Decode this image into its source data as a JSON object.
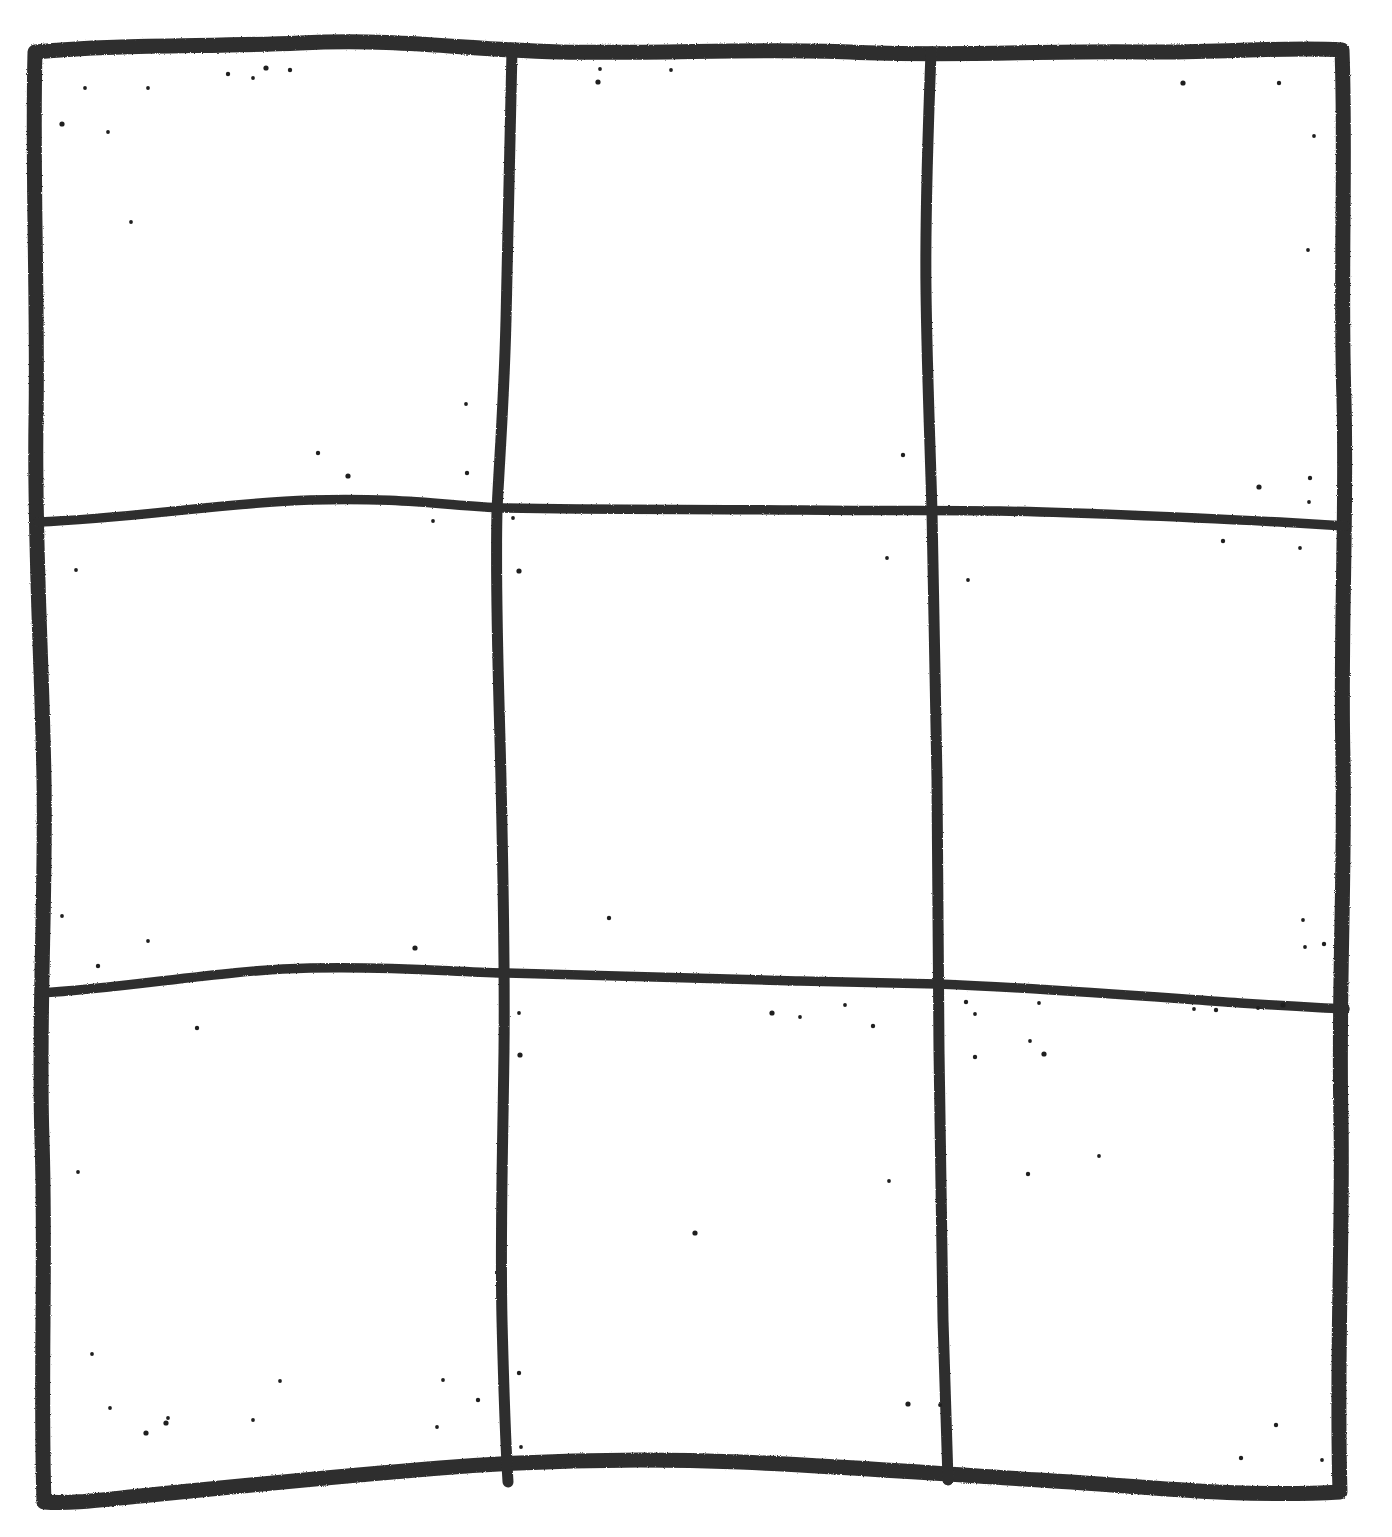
{
  "document": {
    "title": "Hand-drawn tic-tac-toe grid",
    "medium": "black marker on white paper (scanned)",
    "canvas": {
      "width": 1392,
      "height": 1537
    },
    "background_color": "#ffffff",
    "ink_color": "#2f2f2f",
    "speckle_color": "#1f1f1f"
  },
  "grid": {
    "rows": 3,
    "columns": 3,
    "style": "hand-drawn wobbly marker strokes",
    "outer_border": {
      "name": "outer-border",
      "stroke_width_px": 14,
      "top_y": 52,
      "bottom_y": 1480,
      "left_x": 40,
      "right_x": 1340
    },
    "vertical_dividers": [
      {
        "name": "vertical-divider-1",
        "approx_x": 503,
        "stroke_width_px": 10
      },
      {
        "name": "vertical-divider-2",
        "approx_x": 935,
        "stroke_width_px": 10
      }
    ],
    "horizontal_dividers": [
      {
        "name": "horizontal-divider-1",
        "approx_y": 512,
        "stroke_width_px": 9
      },
      {
        "name": "horizontal-divider-2",
        "approx_y": 978,
        "stroke_width_px": 9
      }
    ],
    "cells": [
      {
        "id": "cell-top-left",
        "row": 0,
        "col": 0,
        "mark": ""
      },
      {
        "id": "cell-top-center",
        "row": 0,
        "col": 1,
        "mark": ""
      },
      {
        "id": "cell-top-right",
        "row": 0,
        "col": 2,
        "mark": ""
      },
      {
        "id": "cell-middle-left",
        "row": 1,
        "col": 0,
        "mark": ""
      },
      {
        "id": "cell-middle-center",
        "row": 1,
        "col": 1,
        "mark": ""
      },
      {
        "id": "cell-middle-right",
        "row": 1,
        "col": 2,
        "mark": ""
      },
      {
        "id": "cell-bottom-left",
        "row": 2,
        "col": 0,
        "mark": ""
      },
      {
        "id": "cell-bottom-center",
        "row": 2,
        "col": 1,
        "mark": ""
      },
      {
        "id": "cell-bottom-right",
        "row": 2,
        "col": 2,
        "mark": ""
      }
    ]
  },
  "paths": {
    "outer_border": "M 35,52 C 120,44 210,47 300,43 C 400,38 470,50 560,52 C 660,54 760,48 850,52 C 950,57 1050,50 1150,52 C 1220,53 1290,46 1342,50 C 1346,160 1340,280 1344,400 C 1347,520 1340,640 1343,760 C 1345,880 1338,1000 1341,1120 C 1343,1240 1336,1360 1340,1492 C 1240,1498 1140,1486 1040,1480 C 940,1474 840,1466 740,1462 C 640,1458 540,1460 440,1468 C 340,1476 240,1486 140,1496 C 100,1500 70,1504 44,1502 C 40,1380 46,1260 42,1140 C 38,1020 46,900 44,780 C 42,660 34,540 36,420 C 38,300 32,170 35,52 Z",
    "vertical_divider_1": "M 512,50 C 510,140 508,230 506,320 C 504,400 500,450 497,510 C 495,600 499,690 501,780 C 503,870 505,960 504,1050 C 503,1140 500,1230 502,1320 C 504,1400 506,1450 508,1482",
    "vertical_divider_2": "M 931,52 C 928,130 925,210 926,290 C 927,370 930,440 932,512 C 934,600 936,690 937,780 C 938,870 938,960 939,1050 C 940,1140 941,1230 943,1320 C 945,1400 947,1450 948,1480",
    "horizontal_divider_1": "M 38,522 C 130,519 220,503 310,500 C 400,497 450,506 503,508 C 600,510 700,509 800,510 C 900,511 940,510 1000,511 C 1100,513 1200,518 1280,522 C 1310,524 1330,525 1345,526",
    "horizontal_divider_2": "M 40,993 C 130,988 220,970 310,968 C 400,966 450,972 503,973 C 600,975 700,979 800,981 C 880,983 910,983 938,984 C 1040,988 1140,996 1240,1003 C 1300,1007 1330,1008 1345,1009"
  },
  "speckles": [
    [
      62,
      124
    ],
    [
      85,
      88
    ],
    [
      148,
      88
    ],
    [
      228,
      74
    ],
    [
      253,
      78
    ],
    [
      266,
      68
    ],
    [
      290,
      70
    ],
    [
      108,
      132
    ],
    [
      131,
      222
    ],
    [
      318,
      453
    ],
    [
      348,
      476
    ],
    [
      466,
      404
    ],
    [
      467,
      473
    ],
    [
      433,
      521
    ],
    [
      513,
      518
    ],
    [
      598,
      82
    ],
    [
      600,
      69
    ],
    [
      671,
      70
    ],
    [
      903,
      455
    ],
    [
      887,
      558
    ],
    [
      1183,
      83
    ],
    [
      1279,
      83
    ],
    [
      1314,
      136
    ],
    [
      1308,
      250
    ],
    [
      1310,
      478
    ],
    [
      1259,
      487
    ],
    [
      1309,
      502
    ],
    [
      1223,
      541
    ],
    [
      1300,
      548
    ],
    [
      76,
      570
    ],
    [
      519,
      571
    ],
    [
      968,
      580
    ],
    [
      62,
      916
    ],
    [
      98,
      966
    ],
    [
      148,
      941
    ],
    [
      415,
      948
    ],
    [
      609,
      918
    ],
    [
      1303,
      920
    ],
    [
      1305,
      947
    ],
    [
      1324,
      944
    ],
    [
      1283,
      1005
    ],
    [
      1194,
      1009
    ],
    [
      1216,
      1010
    ],
    [
      1258,
      1008
    ],
    [
      889,
      1181
    ],
    [
      772,
      1013
    ],
    [
      800,
      1017
    ],
    [
      845,
      1005
    ],
    [
      873,
      1026
    ],
    [
      519,
      1013
    ],
    [
      520,
      1055
    ],
    [
      966,
      1002
    ],
    [
      1039,
      1003
    ],
    [
      975,
      1014
    ],
    [
      975,
      1057
    ],
    [
      1044,
      1054
    ],
    [
      78,
      1172
    ],
    [
      197,
      1028
    ],
    [
      92,
      1354
    ],
    [
      110,
      1408
    ],
    [
      166,
      1423
    ],
    [
      253,
      1420
    ],
    [
      280,
      1381
    ],
    [
      519,
      1373
    ],
    [
      521,
      1447
    ],
    [
      908,
      1404
    ],
    [
      1241,
      1458
    ],
    [
      1322,
      1460
    ],
    [
      1404,
      1428
    ],
    [
      1276,
      1425
    ],
    [
      695,
      1233
    ],
    [
      940,
      1405
    ],
    [
      1028,
      1174
    ],
    [
      1030,
      1041
    ],
    [
      1099,
      1156
    ],
    [
      146,
      1433
    ],
    [
      168,
      1418
    ],
    [
      437,
      1427
    ],
    [
      478,
      1400
    ],
    [
      443,
      1380
    ]
  ]
}
